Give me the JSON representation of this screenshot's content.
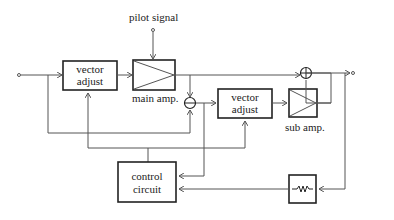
{
  "diagram": {
    "labels": {
      "pilot_signal": "pilot signal",
      "vector_adjust_1_line1": "vector",
      "vector_adjust_1_line2": "adjust",
      "main_amp": "main amp.",
      "vector_adjust_2_line1": "vector",
      "vector_adjust_2_line2": "adjust",
      "sub_amp": "sub amp.",
      "control_circuit_line1": "control",
      "control_circuit_line2": "circuit"
    },
    "symbols": {
      "subtractor": "minus-junction",
      "adder": "plus-junction",
      "attenuator": "resistor"
    }
  }
}
